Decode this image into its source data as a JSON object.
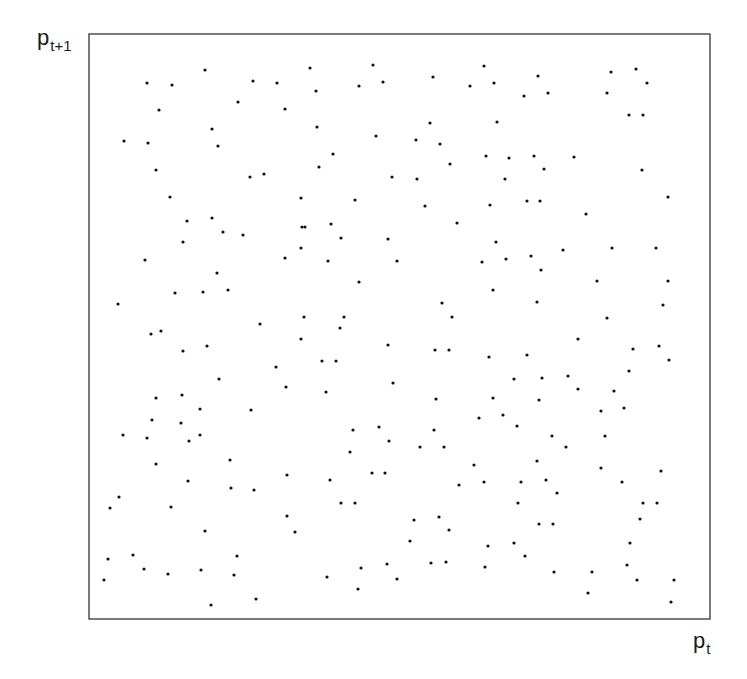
{
  "chart_data": {
    "type": "scatter",
    "title": "",
    "xlabel": "p_t",
    "ylabel": "p_{t+1}",
    "xlabel_parts": {
      "main": "p",
      "sub": "t"
    },
    "ylabel_parts": {
      "main": "p",
      "sub": "t+1"
    },
    "grid": false,
    "legend": null,
    "ticks": "none",
    "xlim": [
      0,
      1
    ],
    "ylim": [
      0,
      1
    ],
    "plot_box_px": {
      "left": 89,
      "top": 34,
      "right": 710,
      "bottom": 619
    },
    "marker": {
      "shape": "dot",
      "radius": 1.6,
      "color": "#111111"
    },
    "frame_color": "#333333",
    "points_px": [
      [
        147,
        83
      ],
      [
        172,
        85
      ],
      [
        205,
        70
      ],
      [
        253,
        81
      ],
      [
        277,
        83
      ],
      [
        159,
        110
      ],
      [
        238,
        102
      ],
      [
        285,
        109
      ],
      [
        212,
        129
      ],
      [
        124,
        141
      ],
      [
        148,
        143
      ],
      [
        218,
        146
      ],
      [
        156,
        170
      ],
      [
        250,
        177
      ],
      [
        264,
        174
      ],
      [
        170,
        197
      ],
      [
        301,
        198
      ],
      [
        187,
        221
      ],
      [
        212,
        218
      ],
      [
        223,
        232
      ],
      [
        243,
        235
      ],
      [
        183,
        242
      ],
      [
        302,
        227
      ],
      [
        301,
        248
      ],
      [
        285,
        258
      ],
      [
        145,
        260
      ],
      [
        217,
        273
      ],
      [
        175,
        293
      ],
      [
        203,
        292
      ],
      [
        228,
        290
      ],
      [
        118,
        304
      ],
      [
        260,
        324
      ],
      [
        304,
        317
      ],
      [
        151,
        334
      ],
      [
        161,
        331
      ],
      [
        301,
        339
      ],
      [
        183,
        351
      ],
      [
        207,
        346
      ],
      [
        276,
        367
      ],
      [
        219,
        379
      ],
      [
        286,
        387
      ],
      [
        156,
        398
      ],
      [
        182,
        395
      ],
      [
        200,
        409
      ],
      [
        251,
        410
      ],
      [
        152,
        420
      ],
      [
        181,
        423
      ],
      [
        200,
        435
      ],
      [
        123,
        435
      ],
      [
        147,
        438
      ],
      [
        189,
        441
      ],
      [
        156,
        464
      ],
      [
        230,
        460
      ],
      [
        188,
        481
      ],
      [
        231,
        488
      ],
      [
        254,
        490
      ],
      [
        287,
        475
      ],
      [
        119,
        497
      ],
      [
        110,
        508
      ],
      [
        171,
        507
      ],
      [
        287,
        516
      ],
      [
        205,
        531
      ],
      [
        295,
        532
      ],
      [
        108,
        559
      ],
      [
        133,
        555
      ],
      [
        237,
        556
      ],
      [
        144,
        569
      ],
      [
        168,
        574
      ],
      [
        201,
        570
      ],
      [
        234,
        575
      ],
      [
        104,
        580
      ],
      [
        211,
        605
      ],
      [
        256,
        599
      ],
      [
        310,
        68
      ],
      [
        373,
        65
      ],
      [
        359,
        86
      ],
      [
        383,
        82
      ],
      [
        433,
        77
      ],
      [
        484,
        66
      ],
      [
        470,
        86
      ],
      [
        494,
        83
      ],
      [
        316,
        91
      ],
      [
        317,
        127
      ],
      [
        430,
        123
      ],
      [
        497,
        122
      ],
      [
        376,
        136
      ],
      [
        416,
        140
      ],
      [
        440,
        144
      ],
      [
        333,
        154
      ],
      [
        319,
        167
      ],
      [
        450,
        164
      ],
      [
        486,
        156
      ],
      [
        509,
        158
      ],
      [
        392,
        177
      ],
      [
        417,
        179
      ],
      [
        505,
        179
      ],
      [
        355,
        200
      ],
      [
        425,
        206
      ],
      [
        490,
        205
      ],
      [
        305,
        227
      ],
      [
        331,
        224
      ],
      [
        457,
        223
      ],
      [
        341,
        238
      ],
      [
        388,
        239
      ],
      [
        328,
        261
      ],
      [
        397,
        261
      ],
      [
        496,
        242
      ],
      [
        482,
        262
      ],
      [
        506,
        259
      ],
      [
        359,
        282
      ],
      [
        493,
        290
      ],
      [
        442,
        303
      ],
      [
        452,
        317
      ],
      [
        344,
        317
      ],
      [
        340,
        328
      ],
      [
        388,
        345
      ],
      [
        435,
        350
      ],
      [
        449,
        350
      ],
      [
        489,
        357
      ],
      [
        322,
        361
      ],
      [
        336,
        361
      ],
      [
        393,
        383
      ],
      [
        514,
        379
      ],
      [
        326,
        392
      ],
      [
        436,
        399
      ],
      [
        493,
        398
      ],
      [
        479,
        418
      ],
      [
        503,
        415
      ],
      [
        353,
        430
      ],
      [
        379,
        427
      ],
      [
        434,
        430
      ],
      [
        350,
        452
      ],
      [
        389,
        441
      ],
      [
        420,
        447
      ],
      [
        444,
        447
      ],
      [
        372,
        473
      ],
      [
        385,
        473
      ],
      [
        330,
        480
      ],
      [
        474,
        465
      ],
      [
        459,
        485
      ],
      [
        484,
        482
      ],
      [
        341,
        503
      ],
      [
        355,
        503
      ],
      [
        414,
        520
      ],
      [
        439,
        517
      ],
      [
        449,
        530
      ],
      [
        410,
        541
      ],
      [
        488,
        546
      ],
      [
        361,
        568
      ],
      [
        387,
        564
      ],
      [
        446,
        562
      ],
      [
        431,
        563
      ],
      [
        327,
        577
      ],
      [
        397,
        579
      ],
      [
        358,
        589
      ],
      [
        485,
        567
      ],
      [
        538,
        76
      ],
      [
        524,
        96
      ],
      [
        548,
        93
      ],
      [
        611,
        72
      ],
      [
        636,
        69
      ],
      [
        647,
        83
      ],
      [
        607,
        93
      ],
      [
        629,
        115
      ],
      [
        643,
        115
      ],
      [
        534,
        156
      ],
      [
        574,
        157
      ],
      [
        544,
        169
      ],
      [
        642,
        170
      ],
      [
        527,
        201
      ],
      [
        540,
        201
      ],
      [
        586,
        214
      ],
      [
        668,
        197
      ],
      [
        531,
        256
      ],
      [
        563,
        250
      ],
      [
        612,
        248
      ],
      [
        656,
        248
      ],
      [
        541,
        270
      ],
      [
        597,
        281
      ],
      [
        668,
        281
      ],
      [
        537,
        302
      ],
      [
        663,
        305
      ],
      [
        607,
        318
      ],
      [
        578,
        339
      ],
      [
        633,
        349
      ],
      [
        659,
        346
      ],
      [
        527,
        355
      ],
      [
        669,
        360
      ],
      [
        629,
        371
      ],
      [
        542,
        378
      ],
      [
        568,
        376
      ],
      [
        578,
        389
      ],
      [
        614,
        391
      ],
      [
        539,
        400
      ],
      [
        601,
        411
      ],
      [
        624,
        408
      ],
      [
        517,
        426
      ],
      [
        552,
        436
      ],
      [
        605,
        436
      ],
      [
        566,
        447
      ],
      [
        537,
        461
      ],
      [
        601,
        468
      ],
      [
        661,
        471
      ],
      [
        521,
        482
      ],
      [
        546,
        480
      ],
      [
        557,
        493
      ],
      [
        622,
        482
      ],
      [
        518,
        503
      ],
      [
        643,
        503
      ],
      [
        657,
        503
      ],
      [
        640,
        519
      ],
      [
        539,
        524
      ],
      [
        553,
        524
      ],
      [
        514,
        543
      ],
      [
        525,
        556
      ],
      [
        630,
        543
      ],
      [
        554,
        572
      ],
      [
        592,
        572
      ],
      [
        627,
        565
      ],
      [
        637,
        580
      ],
      [
        674,
        580
      ],
      [
        588,
        593
      ],
      [
        671,
        602
      ]
    ]
  }
}
